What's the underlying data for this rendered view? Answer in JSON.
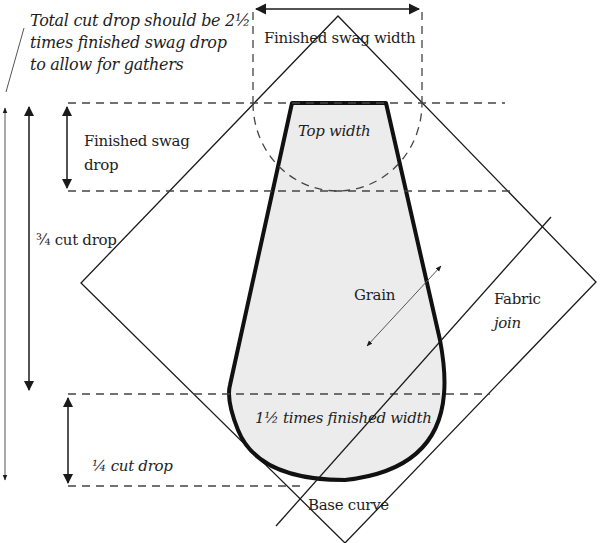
{
  "diagram": {
    "title_note": {
      "line1": "Total cut drop should be 2½",
      "line2": "times finished swag drop",
      "line3": "to allow for gathers"
    },
    "labels": {
      "finished_swag_width": "Finished swag width",
      "top_width": "Top width",
      "finished_swag_drop_line1": "Finished swag",
      "finished_swag_drop_line2": "drop",
      "three_quarter_cut_drop": "¾ cut drop",
      "grain": "Grain",
      "fabric_join_line1": "Fabric",
      "fabric_join_line2": "join",
      "one_half_times_finished_width": "1½ times finished width",
      "quarter_cut_drop": "¼ cut drop",
      "base_curve": "Base curve"
    },
    "colors": {
      "line": "#1a1a1a",
      "dash": "#444444",
      "swag_fill": "#ececec",
      "background": "#ffffff"
    }
  }
}
